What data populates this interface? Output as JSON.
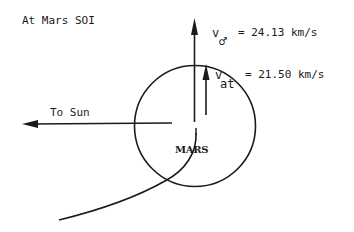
{
  "diagram": {
    "title": "At Mars SOI",
    "planet_label": "MARS",
    "sun_direction_label": "To Sun",
    "vectors": [
      {
        "id": "v_mars",
        "symbol": "v",
        "subscript": "♂",
        "equals_text": "= 24.13 km/s",
        "value": 24.13,
        "unit": "km/s",
        "direction": "up"
      },
      {
        "id": "v_at",
        "symbol": "v",
        "subscript": "at",
        "equals_text": "= 21.50 km/s",
        "value": 21.5,
        "unit": "km/s",
        "direction": "up"
      }
    ],
    "colors": {
      "ink": "#1a1a1a",
      "background": "#ffffff"
    }
  }
}
